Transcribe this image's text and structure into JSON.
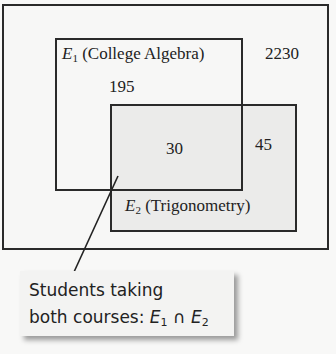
{
  "diagram": {
    "type": "venn",
    "universe": {
      "count": "2230"
    },
    "sets": [
      {
        "id": "E1",
        "var": "E",
        "sub": "1",
        "name": "(College Algebra)",
        "only_count": "195"
      },
      {
        "id": "E2",
        "var": "E",
        "sub": "2",
        "name": "(Trigonometry)",
        "only_count": "45"
      }
    ],
    "intersection": {
      "count": "30"
    },
    "callout": {
      "line1": "Students taking",
      "line2_prefix": "both courses: ",
      "expr": {
        "a_var": "E",
        "a_sub": "1",
        "op": "∩",
        "b_var": "E",
        "b_sub": "2"
      }
    },
    "colors": {
      "border": "#2a2a2a",
      "background": "#f7f7f6",
      "e2_fill": "#ebebea",
      "callout_fill": "#f3f3f2"
    }
  }
}
